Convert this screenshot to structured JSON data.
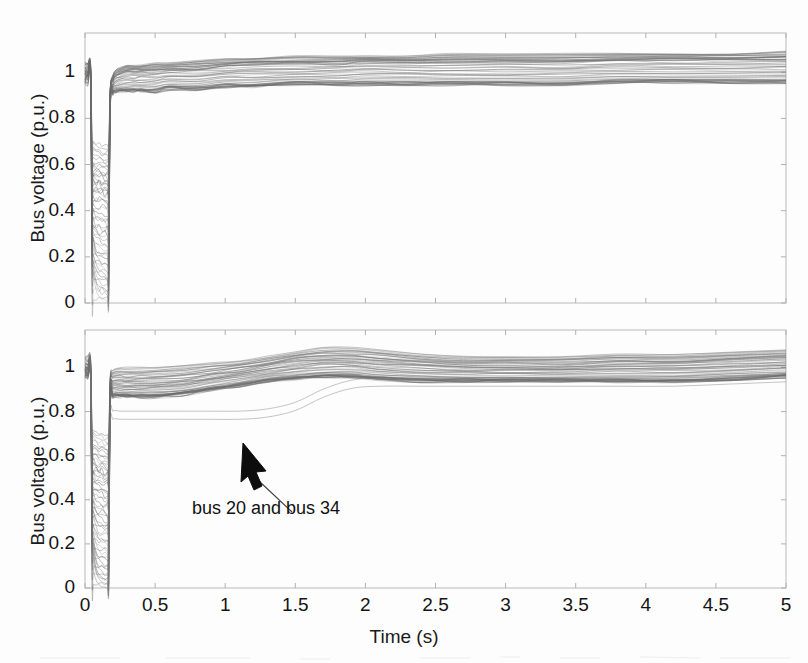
{
  "figure": {
    "background_color": "#fdfdfd",
    "ink_color": "#555555",
    "axis_color": "#b9b9b9"
  },
  "annotation": {
    "label": "bus 20 and bus 34",
    "arrow_icon": "arrow-up-left-icon"
  },
  "chart_data": [
    {
      "id": "top-plot",
      "type": "line",
      "title": "",
      "xlabel": "",
      "ylabel": "Bus voltage (p.u.)",
      "xlim": [
        0,
        5
      ],
      "ylim": [
        0,
        1.17
      ],
      "xticks": [
        0,
        0.5,
        1,
        1.5,
        2,
        2.5,
        3,
        3.5,
        4,
        4.5,
        5
      ],
      "xticklabels": [
        "0",
        "0.5",
        "1",
        "1.5",
        "2",
        "2.5",
        "3",
        "3.5",
        "4",
        "4.5",
        "5"
      ],
      "yticks": [
        0,
        0.2,
        0.4,
        0.6,
        0.8,
        1
      ],
      "yticklabels": [
        "0",
        "0.2",
        "0.4",
        "0.6",
        "0.8",
        "1"
      ],
      "xticklabels_visible": false,
      "grid": false,
      "legend": "none",
      "description": "Bus voltages of many buses during and after a fault: fast recovery case. Fault at t=0.05 s, cleared at t=0.17 s, all voltages recover into a band near 1.0 p.u. within ~0.3 s.",
      "x": [
        0,
        0.02,
        0.04,
        0.05,
        0.06,
        0.08,
        0.1,
        0.12,
        0.14,
        0.16,
        0.17,
        0.18,
        0.2,
        0.22,
        0.25,
        0.3,
        0.35,
        0.4,
        0.5,
        0.6,
        0.8,
        1.0,
        1.2,
        1.5,
        1.8,
        2.0,
        2.3,
        2.6,
        3.0,
        3.4,
        3.8,
        4.2,
        4.6,
        5.0
      ],
      "series": [
        {
          "name": "bus band upper envelope",
          "values": [
            1.04,
            1.04,
            1.03,
            0.72,
            0.7,
            0.69,
            0.69,
            0.68,
            0.68,
            0.68,
            0.69,
            0.93,
            0.99,
            1.01,
            1.02,
            1.03,
            1.03,
            1.03,
            1.04,
            1.04,
            1.05,
            1.06,
            1.06,
            1.07,
            1.07,
            1.07,
            1.07,
            1.08,
            1.08,
            1.08,
            1.08,
            1.08,
            1.08,
            1.09
          ]
        },
        {
          "name": "bus band mid envelope",
          "values": [
            1.0,
            1.0,
            1.0,
            0.48,
            0.45,
            0.44,
            0.44,
            0.44,
            0.43,
            0.43,
            0.44,
            0.9,
            0.96,
            0.98,
            0.99,
            1.0,
            1.0,
            1.0,
            1.0,
            1.01,
            1.01,
            1.02,
            1.03,
            1.03,
            1.03,
            1.04,
            1.04,
            1.04,
            1.04,
            1.04,
            1.05,
            1.05,
            1.05,
            1.05
          ]
        },
        {
          "name": "bus band lower envelope",
          "values": [
            0.97,
            0.97,
            0.96,
            0.22,
            0.12,
            0.06,
            0.03,
            0.02,
            0.02,
            0.01,
            0.02,
            0.86,
            0.91,
            0.92,
            0.92,
            0.92,
            0.92,
            0.92,
            0.92,
            0.93,
            0.93,
            0.94,
            0.94,
            0.95,
            0.95,
            0.95,
            0.95,
            0.95,
            0.95,
            0.95,
            0.96,
            0.96,
            0.96,
            0.96
          ]
        }
      ],
      "n_traces": 39
    },
    {
      "id": "bottom-plot",
      "type": "line",
      "title": "",
      "xlabel": "Time (s)",
      "ylabel": "Bus voltage (p.u.)",
      "xlim": [
        0,
        5
      ],
      "ylim": [
        0,
        1.17
      ],
      "xticks": [
        0,
        0.5,
        1,
        1.5,
        2,
        2.5,
        3,
        3.5,
        4,
        4.5,
        5
      ],
      "xticklabels": [
        "0",
        "0.5",
        "1",
        "1.5",
        "2",
        "2.5",
        "3",
        "3.5",
        "4",
        "4.5",
        "5"
      ],
      "yticks": [
        0,
        0.2,
        0.4,
        0.6,
        0.8,
        1
      ],
      "yticklabels": [
        "0",
        "0.2",
        "0.4",
        "0.6",
        "0.8",
        "1"
      ],
      "grid": false,
      "legend": "none",
      "description": "Bus voltages for slower-recovery case: after fault clearing the band sits near 0.85-1.0 and only climbs back to ~1.05 by t=1.8 s; two traces (bus 20 and bus 34) lag in a separate low branch near 0.65-0.80 p.u.",
      "x": [
        0,
        0.02,
        0.04,
        0.05,
        0.06,
        0.08,
        0.1,
        0.12,
        0.14,
        0.16,
        0.17,
        0.18,
        0.2,
        0.25,
        0.3,
        0.4,
        0.5,
        0.7,
        0.9,
        1.1,
        1.3,
        1.5,
        1.7,
        1.9,
        2.1,
        2.4,
        2.7,
        3.0,
        3.4,
        3.8,
        4.2,
        4.6,
        5.0
      ],
      "series": [
        {
          "name": "bus band upper envelope",
          "values": [
            1.05,
            1.05,
            1.04,
            0.74,
            0.72,
            0.71,
            0.7,
            0.7,
            0.69,
            0.69,
            0.7,
            0.96,
            0.99,
            1.0,
            1.0,
            1.0,
            1.0,
            1.01,
            1.02,
            1.03,
            1.05,
            1.07,
            1.09,
            1.09,
            1.08,
            1.06,
            1.05,
            1.05,
            1.05,
            1.06,
            1.06,
            1.07,
            1.08
          ]
        },
        {
          "name": "bus band mid envelope",
          "values": [
            1.0,
            1.0,
            0.99,
            0.5,
            0.47,
            0.46,
            0.45,
            0.45,
            0.44,
            0.44,
            0.45,
            0.9,
            0.93,
            0.93,
            0.93,
            0.93,
            0.93,
            0.94,
            0.96,
            0.98,
            1.0,
            1.02,
            1.03,
            1.03,
            1.02,
            1.01,
            1.0,
            1.0,
            1.0,
            1.01,
            1.01,
            1.02,
            1.03
          ]
        },
        {
          "name": "bus band lower envelope",
          "values": [
            0.96,
            0.96,
            0.95,
            0.24,
            0.14,
            0.07,
            0.04,
            0.03,
            0.02,
            0.02,
            0.03,
            0.84,
            0.87,
            0.87,
            0.87,
            0.87,
            0.87,
            0.88,
            0.9,
            0.92,
            0.94,
            0.95,
            0.96,
            0.96,
            0.95,
            0.94,
            0.94,
            0.94,
            0.94,
            0.94,
            0.94,
            0.95,
            0.96
          ]
        },
        {
          "name": "bus 20 and bus 34",
          "values": [
            0.97,
            0.97,
            0.96,
            0.22,
            0.1,
            0.05,
            0.03,
            0.02,
            0.02,
            0.01,
            0.02,
            0.74,
            0.78,
            0.78,
            0.78,
            0.78,
            0.78,
            0.78,
            0.78,
            0.78,
            0.79,
            0.82,
            0.88,
            0.92,
            0.93,
            0.93,
            0.93,
            0.93,
            0.93,
            0.93,
            0.93,
            0.94,
            0.95
          ]
        }
      ],
      "n_traces": 39
    }
  ]
}
